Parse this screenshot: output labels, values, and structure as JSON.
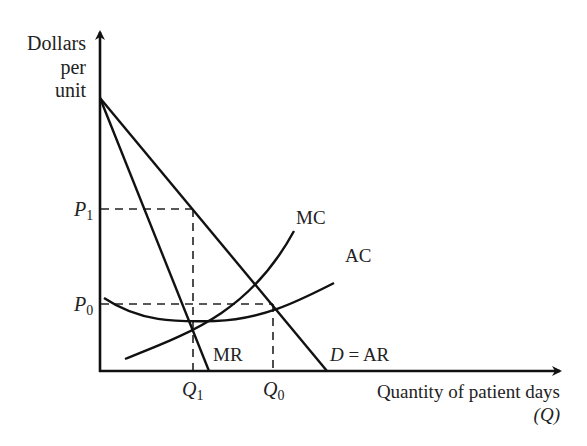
{
  "diagram": {
    "type": "economics-monopoly-cost-revenue",
    "y_axis_label": [
      "Dollars",
      "per",
      "unit"
    ],
    "x_axis_label": "Quantity of patient days",
    "x_axis_symbol": "(Q)",
    "price_labels": {
      "p1": {
        "main": "P",
        "sub": "1"
      },
      "p0": {
        "main": "P",
        "sub": "0"
      }
    },
    "quantity_labels": {
      "q1": {
        "main": "Q",
        "sub": "1"
      },
      "q0": {
        "main": "Q",
        "sub": "0"
      }
    },
    "curves": {
      "mc": "MC",
      "ac": "AC",
      "mr": "MR",
      "demand_main": "D",
      "demand_rest": " = AR"
    },
    "colors": {
      "line": "#111111",
      "text": "#222222",
      "background": "#ffffff"
    }
  }
}
